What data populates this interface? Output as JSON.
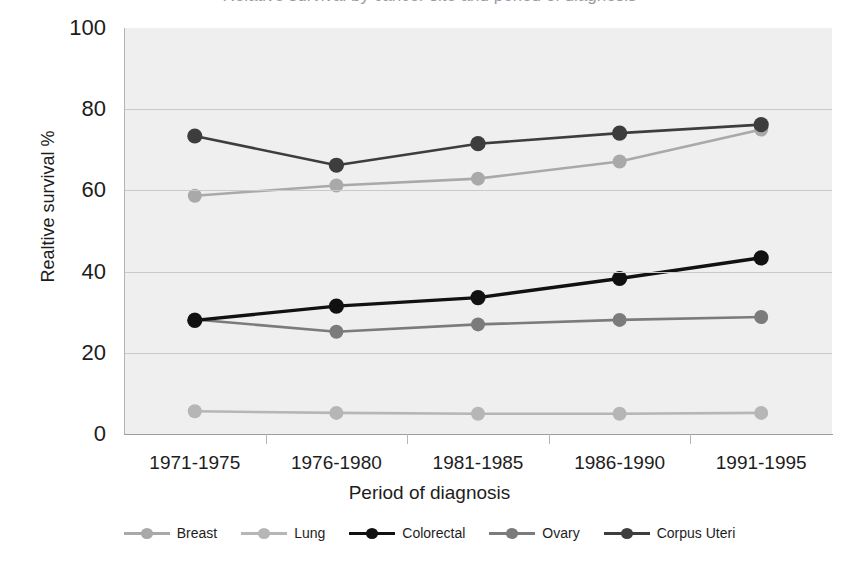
{
  "figure": {
    "cropped_title": "Relative survival by cancer site and period of diagnosis"
  },
  "axes": {
    "y_title": "Realtive survival %",
    "x_title": "Period of diagnosis",
    "y_ticks": [
      "0",
      "20",
      "40",
      "60",
      "80",
      "100"
    ],
    "x_ticks": [
      "1971-1975",
      "1976-1980",
      "1981-1985",
      "1986-1990",
      "1991-1995"
    ]
  },
  "legend": {
    "items": [
      {
        "label": "Breast",
        "color": "#a9a9a9"
      },
      {
        "label": "Lung",
        "color": "#b6b6b6"
      },
      {
        "label": "Colorectal",
        "color": "#111111"
      },
      {
        "label": "Ovary",
        "color": "#7b7b7b"
      },
      {
        "label": "Corpus Uteri",
        "color": "#3d3d3d"
      }
    ]
  },
  "chart_data": {
    "type": "line",
    "title": "Relative survival by cancer site and period of diagnosis",
    "xlabel": "Period of diagnosis",
    "ylabel": "Realtive survival %",
    "ylim": [
      0,
      100
    ],
    "yticks": [
      0,
      20,
      40,
      60,
      80,
      100
    ],
    "grid": "horizontal",
    "legend_position": "bottom",
    "categories": [
      "1971-1975",
      "1976-1980",
      "1981-1985",
      "1986-1990",
      "1991-1995"
    ],
    "series": [
      {
        "name": "Breast",
        "color": "#a9a9a9",
        "values": [
          58.7,
          61.2,
          62.9,
          67.1,
          75.0
        ]
      },
      {
        "name": "Lung",
        "color": "#b6b6b6",
        "values": [
          5.6,
          5.2,
          5.0,
          5.0,
          5.2
        ]
      },
      {
        "name": "Colorectal",
        "color": "#111111",
        "values": [
          28.0,
          31.5,
          33.6,
          38.3,
          43.4
        ]
      },
      {
        "name": "Ovary",
        "color": "#7b7b7b",
        "values": [
          28.2,
          25.2,
          27.0,
          28.1,
          28.8
        ]
      },
      {
        "name": "Corpus Uteri",
        "color": "#3d3d3d",
        "values": [
          73.4,
          66.2,
          71.5,
          74.1,
          76.2
        ]
      }
    ]
  }
}
